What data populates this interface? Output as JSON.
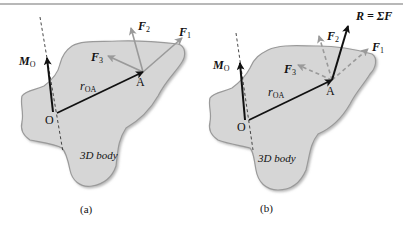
{
  "figure": {
    "panels": [
      {
        "id": "a",
        "caption": "(a)",
        "body_label": "3D body",
        "point_O": "O",
        "point_A": "A",
        "moment": {
          "main": "M",
          "sub": "O"
        },
        "position_vector": {
          "main": "r",
          "sub": "OA"
        },
        "forces": [
          {
            "main": "F",
            "sub": "1",
            "style": "solid-gray"
          },
          {
            "main": "F",
            "sub": "2",
            "style": "solid-gray"
          },
          {
            "main": "F",
            "sub": "3",
            "style": "solid-gray"
          }
        ]
      },
      {
        "id": "b",
        "caption": "(b)",
        "body_label": "3D body",
        "point_O": "O",
        "point_A": "A",
        "moment": {
          "main": "M",
          "sub": "O"
        },
        "position_vector": {
          "main": "r",
          "sub": "OA"
        },
        "resultant": "R = ΣF",
        "forces": [
          {
            "main": "F",
            "sub": "1",
            "style": "dashed-gray"
          },
          {
            "main": "F",
            "sub": "2",
            "style": "dashed-gray"
          },
          {
            "main": "F",
            "sub": "3",
            "style": "dashed-gray"
          }
        ]
      }
    ],
    "colors": {
      "body_fill": "#d6d6d6",
      "body_edge": "#9a9a9a",
      "vector_dark": "#111111",
      "force_gray": "#9a9a9a"
    }
  }
}
